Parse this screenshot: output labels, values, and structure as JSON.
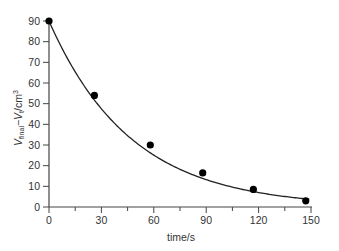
{
  "chart_data": {
    "type": "scatter",
    "title": "",
    "xlabel": "time/s",
    "ylabel": "V_final − V_t /cm³",
    "ylabel_parts": {
      "V1": "V",
      "sub1": "final",
      "dash": "−",
      "V2": "V",
      "sub2": "t",
      "unit": "/cm",
      "sup": "3"
    },
    "xlim": [
      0,
      150
    ],
    "ylim": [
      0,
      90
    ],
    "x_ticks": [
      0,
      30,
      60,
      90,
      120,
      150
    ],
    "x_minor_ticks": [
      15,
      45,
      75,
      105,
      135
    ],
    "y_ticks": [
      0,
      10,
      20,
      30,
      40,
      50,
      60,
      70,
      80,
      90
    ],
    "grid": false,
    "legend": null,
    "series": [
      {
        "name": "measured",
        "marker": "filled-circle",
        "color": "#000000",
        "x": [
          0,
          26,
          58,
          88,
          117,
          147
        ],
        "y": [
          90,
          54,
          30,
          16.5,
          8.5,
          3
        ]
      }
    ],
    "fit_curve": {
      "type": "exponential-decay",
      "color": "#222222",
      "x_range": [
        0,
        149
      ]
    }
  }
}
